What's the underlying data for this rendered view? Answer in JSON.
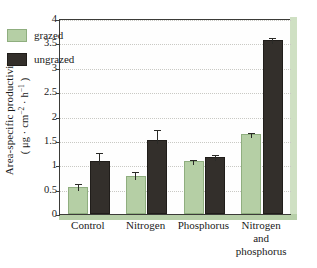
{
  "chart_data": {
    "type": "bar",
    "title": "",
    "subtitle": "",
    "xlabel": "",
    "ylabel_line1": "Area-specific productivity",
    "ylabel_line2_prefix": "( μg · cm",
    "ylabel_line2_sup1": "−2",
    "ylabel_line2_mid": " · h",
    "ylabel_line2_sup2": "−1",
    "ylabel_line2_suffix": " )",
    "ylabel_plain": "Area-specific productivity ( μg · cm⁻² · h⁻¹ )",
    "categories": [
      "Control",
      "Nitrogen",
      "Phosphorus",
      "Nitrogen and phosphorus"
    ],
    "category_lines": [
      [
        "Control"
      ],
      [
        "Nitrogen"
      ],
      [
        "Phosphorus"
      ],
      [
        "Nitrogen",
        "and",
        "phosphorus"
      ]
    ],
    "series": [
      {
        "name": "grazed",
        "color": "#b5cfa5",
        "values": [
          0.56,
          0.78,
          1.08,
          1.64
        ],
        "errors": [
          0.08,
          0.1,
          0.05,
          0.05
        ]
      },
      {
        "name": "ungrazed",
        "color": "#332f2b",
        "values": [
          1.09,
          1.52,
          1.17,
          3.56
        ],
        "errors": [
          0.18,
          0.22,
          0.07,
          0.08
        ]
      }
    ],
    "ylim": [
      0,
      4
    ],
    "ytick_values": [
      0,
      0.5,
      1,
      1.5,
      2,
      2.5,
      3,
      3.5,
      4
    ],
    "ytick_labels": [
      "0",
      "0.5",
      "1",
      "1.5",
      "2",
      "2.5",
      "3",
      "3.5",
      "4"
    ],
    "grid": true,
    "grid_axis": "y",
    "grid_style": "dotted",
    "legend_position": "upper-left-inside",
    "error_bars": "standard error",
    "frame_accent_color": "#b7cfa8",
    "axis_color": "#3b3b38"
  },
  "legend": {
    "entries": [
      {
        "label": "grazed",
        "swatch": "grazed"
      },
      {
        "label": "ungrazed",
        "swatch": "ungrazed"
      }
    ]
  }
}
